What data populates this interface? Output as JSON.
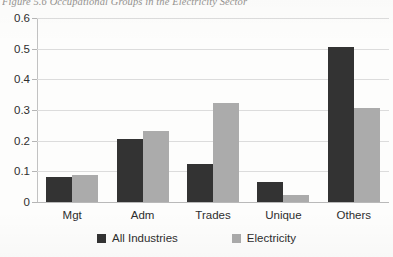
{
  "caption": "Figure 5.6 Occupational Groups in the Electricity Sector",
  "legend": {
    "position": "bottom",
    "items": [
      {
        "label": "All Industries",
        "color": "#333333"
      },
      {
        "label": "Electricity",
        "color": "#ababab"
      }
    ]
  },
  "chart_data": {
    "type": "bar",
    "title": "Figure 5.6 Occupational Groups in the Electricity Sector",
    "xlabel": "",
    "ylabel": "",
    "categories": [
      "Mgt",
      "Adm",
      "Trades",
      "Unique",
      "Others"
    ],
    "series": [
      {
        "name": "All Industries",
        "color": "#333333",
        "values": [
          0.082,
          0.205,
          0.123,
          0.065,
          0.505
        ]
      },
      {
        "name": "Electricity",
        "color": "#ababab",
        "values": [
          0.088,
          0.232,
          0.324,
          0.022,
          0.307
        ]
      }
    ],
    "ylim": [
      0,
      0.6
    ],
    "yticks": [
      0,
      0.1,
      0.2,
      0.3,
      0.4,
      0.5,
      0.6
    ],
    "ytick_labels": [
      "0",
      "0.1",
      "0.2",
      "0.3",
      "0.4",
      "0.5",
      "0.6"
    ],
    "grid": true,
    "grid_axis": "y",
    "legend_position": "bottom"
  }
}
